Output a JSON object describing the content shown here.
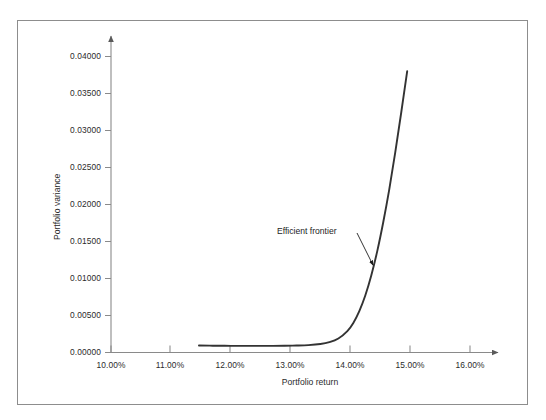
{
  "chart_data": {
    "type": "line",
    "title": "",
    "xlabel": "Portfolio return",
    "ylabel": "Portfolio variance",
    "xlim": [
      10.0,
      16.0
    ],
    "ylim": [
      0.0,
      0.04
    ],
    "x_tick_labels": [
      "10.00%",
      "11.00%",
      "12.00%",
      "13.00%",
      "14.00%",
      "15.00%",
      "16.00%"
    ],
    "x_tick_values": [
      10.0,
      11.0,
      12.0,
      13.0,
      14.0,
      15.0,
      16.0
    ],
    "y_tick_labels": [
      "0.00000",
      "0.00500",
      "0.01000",
      "0.01500",
      "0.02000",
      "0.02500",
      "0.03000",
      "0.03500",
      "0.04000"
    ],
    "y_tick_values": [
      0.0,
      0.005,
      0.01,
      0.015,
      0.02,
      0.025,
      0.03,
      0.035,
      0.04
    ],
    "grid": false,
    "legend": false,
    "series": [
      {
        "name": "Efficient frontier",
        "x": [
          11.47,
          11.7,
          12.0,
          12.3,
          12.6,
          12.9,
          13.1,
          13.3,
          13.5,
          13.65,
          13.8,
          13.95,
          14.05,
          14.15,
          14.25,
          14.35,
          14.45,
          14.55,
          14.65,
          14.75,
          14.85,
          14.95
        ],
        "y": [
          0.00095,
          0.00092,
          0.0009,
          0.00089,
          0.00089,
          0.00091,
          0.00094,
          0.001,
          0.00115,
          0.0014,
          0.0019,
          0.0029,
          0.004,
          0.0056,
          0.0077,
          0.0104,
          0.0137,
          0.0176,
          0.022,
          0.027,
          0.0324,
          0.038
        ]
      }
    ],
    "annotations": [
      {
        "text": "Efficient frontier",
        "target_x": 14.38,
        "target_y": 0.0118
      }
    ],
    "colors": {
      "curve": "#333333",
      "axis": "#8a8a8a",
      "frame": "#8d8d8d",
      "text": "#2b2b2b",
      "annotation": "#1d1d1d",
      "background": "#ffffff"
    }
  }
}
